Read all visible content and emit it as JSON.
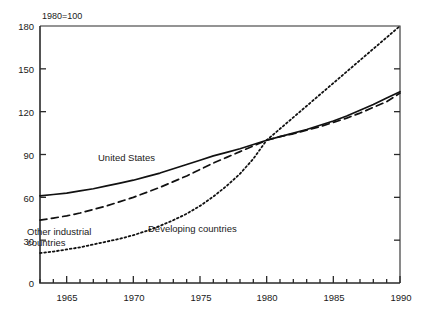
{
  "chart_data": {
    "type": "line",
    "title": "",
    "subtitle": "",
    "index_note": "1980=100",
    "xlabel": "",
    "ylabel": "",
    "xlim": [
      1963,
      1990
    ],
    "ylim": [
      0,
      180
    ],
    "ytick_values": [
      0,
      30,
      60,
      90,
      120,
      150,
      180
    ],
    "ytick_labels": [
      "0",
      "30",
      "60",
      "90",
      "120",
      "150",
      "180"
    ],
    "xtick_values": [
      1965,
      1970,
      1975,
      1980,
      1985,
      1990
    ],
    "xtick_labels": [
      "1965",
      "1970",
      "1975",
      "1980",
      "1985",
      "1990"
    ],
    "xtick_minor_step": 1,
    "grid": false,
    "legend_position": "inline-annotations",
    "x": [
      1963,
      1964,
      1965,
      1966,
      1967,
      1968,
      1969,
      1970,
      1971,
      1972,
      1973,
      1974,
      1975,
      1976,
      1977,
      1978,
      1979,
      1980,
      1981,
      1982,
      1983,
      1984,
      1985,
      1986,
      1987,
      1988,
      1989,
      1990
    ],
    "series": [
      {
        "name": "United States",
        "style": "solid",
        "color": "#111111",
        "values": [
          61,
          62,
          63,
          64.5,
          66,
          68,
          70,
          72,
          74.5,
          77,
          80,
          83,
          86,
          89,
          91.5,
          94,
          97,
          100,
          102.5,
          105,
          107.5,
          110.5,
          113.5,
          117,
          121,
          125,
          129.5,
          134
        ]
      },
      {
        "name": "Other industrial countries",
        "style": "dashed",
        "color": "#111111",
        "values": [
          44,
          45.5,
          47,
          49,
          51.5,
          54,
          57,
          60,
          63.5,
          67,
          71,
          75,
          79.5,
          84,
          88,
          92,
          96,
          100,
          102.5,
          104.5,
          107,
          109.5,
          112.5,
          115.5,
          119,
          123,
          127,
          133
        ]
      },
      {
        "name": "Developing countries",
        "style": "dotted",
        "color": "#111111",
        "values": [
          21,
          22,
          23.5,
          25,
          27,
          29,
          31,
          33.5,
          36.5,
          40,
          44,
          48.5,
          54,
          60.5,
          68,
          76.5,
          87,
          100,
          108,
          116,
          124,
          132,
          140,
          148,
          156,
          164,
          172,
          180
        ]
      }
    ],
    "annotations": [
      {
        "text": "United States",
        "x_px": 98,
        "y_px": 158
      },
      {
        "text": "Other industrial countries",
        "x_px": 27,
        "y_px": 232
      },
      {
        "text": "Developing countries",
        "x_px": 148,
        "y_px": 228
      }
    ]
  },
  "frame": {
    "axis_color": "#2a2a2a",
    "background": "#ffffff"
  }
}
